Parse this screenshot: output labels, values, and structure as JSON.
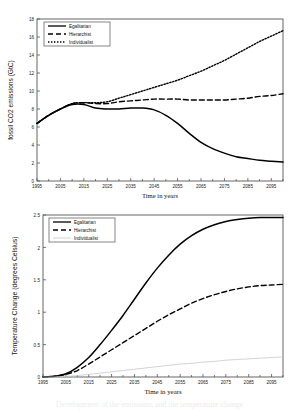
{
  "figure": {
    "caption_fragment": "Development of the emissions and the temperature change"
  },
  "chart_data": [
    {
      "id": "fossil-co2-emissions",
      "type": "line",
      "title": "",
      "xlabel": "Time in years",
      "ylabel": "fossil CO2 emissions (GtC)",
      "xlim": [
        1995,
        2100
      ],
      "ylim": [
        0,
        18
      ],
      "yticks": [
        "0",
        "2",
        "4",
        "6",
        "8",
        "10",
        "12",
        "14",
        "16",
        "18"
      ],
      "ytick_values": [
        0,
        2,
        4,
        6,
        8,
        10,
        12,
        14,
        16,
        18
      ],
      "xticks": [
        "1995",
        "2005",
        "2015",
        "2025",
        "2035",
        "2045",
        "2055",
        "2065",
        "2075",
        "2085",
        "2095"
      ],
      "xtick_values": [
        1995,
        2005,
        2015,
        2025,
        2035,
        2045,
        2055,
        2065,
        2075,
        2085,
        2095
      ],
      "grid": false,
      "legend_position": "top-left",
      "series": [
        {
          "name": "Egalitarian",
          "style": "solid",
          "color": "#000000",
          "x": [
            1995,
            2000,
            2005,
            2010,
            2015,
            2020,
            2025,
            2030,
            2035,
            2040,
            2045,
            2050,
            2055,
            2060,
            2065,
            2070,
            2075,
            2080,
            2085,
            2090,
            2095,
            2100
          ],
          "values": [
            6.4,
            7.3,
            8.0,
            8.5,
            8.5,
            8.1,
            8.0,
            8.0,
            8.1,
            8.1,
            7.9,
            7.3,
            6.4,
            5.3,
            4.3,
            3.6,
            3.1,
            2.7,
            2.5,
            2.3,
            2.2,
            2.1
          ]
        },
        {
          "name": "Hierarchist",
          "style": "dashed",
          "color": "#000000",
          "x": [
            1995,
            2000,
            2005,
            2010,
            2015,
            2020,
            2025,
            2030,
            2035,
            2040,
            2045,
            2050,
            2055,
            2060,
            2065,
            2070,
            2075,
            2080,
            2085,
            2090,
            2095,
            2100
          ],
          "values": [
            6.4,
            7.3,
            8.0,
            8.6,
            8.7,
            8.6,
            8.6,
            8.8,
            8.9,
            9.0,
            9.1,
            9.1,
            9.1,
            9.0,
            9.0,
            9.0,
            9.0,
            9.1,
            9.2,
            9.4,
            9.5,
            9.7
          ]
        },
        {
          "name": "Individualist",
          "style": "dotted",
          "color": "#000000",
          "x": [
            1995,
            2000,
            2005,
            2010,
            2015,
            2020,
            2025,
            2030,
            2035,
            2040,
            2045,
            2050,
            2055,
            2060,
            2065,
            2070,
            2075,
            2080,
            2085,
            2090,
            2095,
            2100
          ],
          "values": [
            6.4,
            7.3,
            8.0,
            8.6,
            8.7,
            8.7,
            8.8,
            9.2,
            9.6,
            10.0,
            10.4,
            10.8,
            11.2,
            11.7,
            12.2,
            12.8,
            13.4,
            14.1,
            14.8,
            15.5,
            16.1,
            16.7
          ]
        }
      ]
    },
    {
      "id": "temperature-change",
      "type": "line",
      "title": "",
      "xlabel": "Time in years",
      "ylabel": "Temperature Change (degrees Celsius)",
      "xlim": [
        1995,
        2100
      ],
      "ylim": [
        0,
        2.5
      ],
      "yticks": [
        "0",
        "0.5",
        "1",
        "1.5",
        "2",
        "2.5"
      ],
      "ytick_values": [
        0,
        0.5,
        1,
        1.5,
        2,
        2.5
      ],
      "xticks": [
        "1995",
        "2005",
        "2015",
        "2025",
        "2035",
        "2045",
        "2055",
        "2065",
        "2075",
        "2085",
        "2095"
      ],
      "xtick_values": [
        1995,
        2005,
        2015,
        2025,
        2035,
        2045,
        2055,
        2065,
        2075,
        2085,
        2095
      ],
      "grid": false,
      "legend_position": "top-left",
      "series": [
        {
          "name": "Egalitarian",
          "style": "solid",
          "color": "#000000",
          "x": [
            1995,
            2000,
            2005,
            2010,
            2015,
            2020,
            2025,
            2030,
            2035,
            2040,
            2045,
            2050,
            2055,
            2060,
            2065,
            2070,
            2075,
            2080,
            2085,
            2090,
            2095,
            2100
          ],
          "values": [
            0.0,
            0.01,
            0.05,
            0.15,
            0.3,
            0.5,
            0.72,
            0.95,
            1.2,
            1.45,
            1.68,
            1.88,
            2.05,
            2.18,
            2.28,
            2.35,
            2.4,
            2.43,
            2.45,
            2.46,
            2.46,
            2.46
          ]
        },
        {
          "name": "Hierarchist",
          "style": "dashed",
          "color": "#000000",
          "x": [
            1995,
            2000,
            2005,
            2010,
            2015,
            2020,
            2025,
            2030,
            2035,
            2040,
            2045,
            2050,
            2055,
            2060,
            2065,
            2070,
            2075,
            2080,
            2085,
            2090,
            2095,
            2100
          ],
          "values": [
            0.0,
            0.01,
            0.04,
            0.1,
            0.2,
            0.31,
            0.42,
            0.53,
            0.64,
            0.75,
            0.86,
            0.96,
            1.05,
            1.14,
            1.21,
            1.27,
            1.32,
            1.36,
            1.39,
            1.41,
            1.42,
            1.43
          ]
        },
        {
          "name": "Individualist",
          "style": "solid-light",
          "color": "#c8c8c8",
          "x": [
            1995,
            2000,
            2005,
            2010,
            2015,
            2020,
            2025,
            2030,
            2035,
            2040,
            2045,
            2050,
            2055,
            2060,
            2065,
            2070,
            2075,
            2080,
            2085,
            2090,
            2095,
            2100
          ],
          "values": [
            0.0,
            0.0,
            0.01,
            0.02,
            0.04,
            0.06,
            0.08,
            0.1,
            0.12,
            0.14,
            0.16,
            0.18,
            0.2,
            0.21,
            0.23,
            0.24,
            0.26,
            0.27,
            0.28,
            0.29,
            0.3,
            0.31
          ]
        }
      ]
    }
  ]
}
